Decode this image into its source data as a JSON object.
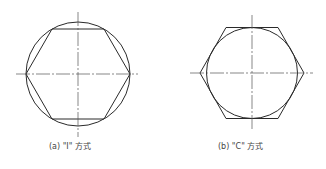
{
  "figures": [
    {
      "id": "a",
      "caption": "(a) \"I\" 方式",
      "description": "Hexagon inscribed in circle (vertices on circle)"
    },
    {
      "id": "b",
      "caption": "(b) \"C\" 方式",
      "description": "Hexagon circumscribed about circle (circle tangent to flats)"
    }
  ],
  "colors": {
    "line": "#2a2a2a",
    "axis": "#555555"
  }
}
